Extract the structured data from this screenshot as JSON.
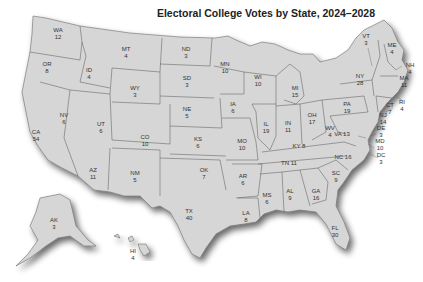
{
  "title": "Electoral College Votes by State, 2024–2028",
  "states": [
    {
      "abbr": "WA",
      "votes": "12",
      "x": 58,
      "y": 32
    },
    {
      "abbr": "OR",
      "votes": "8",
      "x": 47,
      "y": 66
    },
    {
      "abbr": "CA",
      "votes": "54",
      "x": 36,
      "y": 134
    },
    {
      "abbr": "NV",
      "votes": "6",
      "x": 64,
      "y": 117
    },
    {
      "abbr": "ID",
      "votes": "4",
      "x": 89,
      "y": 72
    },
    {
      "abbr": "MT",
      "votes": "4",
      "x": 126,
      "y": 51
    },
    {
      "abbr": "WY",
      "votes": "3",
      "x": 135,
      "y": 90
    },
    {
      "abbr": "UT",
      "votes": "6",
      "x": 101,
      "y": 126
    },
    {
      "abbr": "CO",
      "votes": "10",
      "x": 145,
      "y": 139
    },
    {
      "abbr": "AZ",
      "votes": "11",
      "x": 93,
      "y": 172
    },
    {
      "abbr": "NM",
      "votes": "5",
      "x": 135,
      "y": 175
    },
    {
      "abbr": "ND",
      "votes": "3",
      "x": 186,
      "y": 51
    },
    {
      "abbr": "SD",
      "votes": "3",
      "x": 187,
      "y": 80
    },
    {
      "abbr": "NE",
      "votes": "5",
      "x": 187,
      "y": 111
    },
    {
      "abbr": "KS",
      "votes": "6",
      "x": 198,
      "y": 141
    },
    {
      "abbr": "OK",
      "votes": "7",
      "x": 204,
      "y": 172
    },
    {
      "abbr": "TX",
      "votes": "40",
      "x": 189,
      "y": 213
    },
    {
      "abbr": "MN",
      "votes": "10",
      "x": 225,
      "y": 66
    },
    {
      "abbr": "IA",
      "votes": "6",
      "x": 233,
      "y": 106
    },
    {
      "abbr": "MO",
      "votes": "10",
      "x": 242,
      "y": 143
    },
    {
      "abbr": "AR",
      "votes": "6",
      "x": 243,
      "y": 178
    },
    {
      "abbr": "LA",
      "votes": "8",
      "x": 246,
      "y": 215
    },
    {
      "abbr": "WI",
      "votes": "10",
      "x": 258,
      "y": 79
    },
    {
      "abbr": "IL",
      "votes": "19",
      "x": 266,
      "y": 126
    },
    {
      "abbr": "MI",
      "votes": "15",
      "x": 295,
      "y": 90
    },
    {
      "abbr": "IN",
      "votes": "11",
      "x": 288,
      "y": 125
    },
    {
      "abbr": "OH",
      "votes": "17",
      "x": 312,
      "y": 117
    },
    {
      "abbr": "KY",
      "votes": "8",
      "x": 299,
      "y": 148,
      "inline": true
    },
    {
      "abbr": "TN",
      "votes": "11",
      "x": 289,
      "y": 165,
      "inline": true
    },
    {
      "abbr": "MS",
      "votes": "6",
      "x": 267,
      "y": 197
    },
    {
      "abbr": "AL",
      "votes": "9",
      "x": 290,
      "y": 193
    },
    {
      "abbr": "GA",
      "votes": "16",
      "x": 316,
      "y": 193
    },
    {
      "abbr": "FL",
      "votes": "30",
      "x": 335,
      "y": 230
    },
    {
      "abbr": "SC",
      "votes": "9",
      "x": 336,
      "y": 175
    },
    {
      "abbr": "NC",
      "votes": "16",
      "x": 343,
      "y": 159,
      "inline": true
    },
    {
      "abbr": "VA",
      "votes": "13",
      "x": 342,
      "y": 136,
      "inline": true
    },
    {
      "abbr": "WV",
      "votes": "4",
      "x": 330,
      "y": 130
    },
    {
      "abbr": "PA",
      "votes": "19",
      "x": 347,
      "y": 106
    },
    {
      "abbr": "NY",
      "votes": "28",
      "x": 360,
      "y": 78
    },
    {
      "abbr": "VT",
      "votes": "3",
      "x": 366,
      "y": 38
    },
    {
      "abbr": "ME",
      "votes": "4",
      "x": 392,
      "y": 47
    },
    {
      "abbr": "NH",
      "votes": "4",
      "x": 410,
      "y": 67
    },
    {
      "abbr": "MA",
      "votes": "11",
      "x": 404,
      "y": 80
    },
    {
      "abbr": "RI",
      "votes": "4",
      "x": 402,
      "y": 104
    },
    {
      "abbr": "CT",
      "votes": "7",
      "x": 390,
      "y": 107
    },
    {
      "abbr": "NJ",
      "votes": "14",
      "x": 383,
      "y": 117
    },
    {
      "abbr": "DE",
      "votes": "3",
      "x": 381,
      "y": 130
    },
    {
      "abbr": "MD",
      "votes": "10",
      "x": 380,
      "y": 143
    },
    {
      "abbr": "DC",
      "votes": "3",
      "x": 381,
      "y": 157
    },
    {
      "abbr": "AK",
      "votes": "3",
      "x": 54,
      "y": 222
    },
    {
      "abbr": "HI",
      "votes": "4",
      "x": 133,
      "y": 253
    }
  ]
}
